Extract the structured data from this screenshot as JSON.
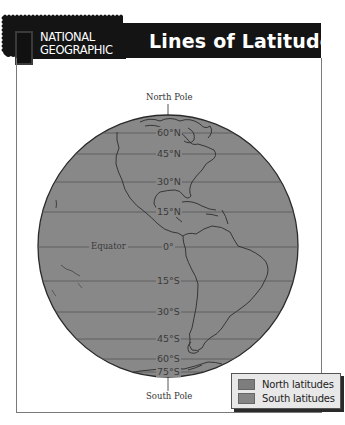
{
  "header": {
    "logo_line1": "NATIONAL",
    "logo_line2": "GEOGRAPHIC",
    "title": "Lines of Latitude"
  },
  "map": {
    "north_pole_label": "North Pole",
    "south_pole_label": "South Pole",
    "equator_label": "Equator",
    "latitudes": [
      {
        "label": "60°N",
        "hemisphere": "north"
      },
      {
        "label": "45°N",
        "hemisphere": "north"
      },
      {
        "label": "30°N",
        "hemisphere": "north"
      },
      {
        "label": "15°N",
        "hemisphere": "north"
      },
      {
        "label": "0°",
        "hemisphere": "equator"
      },
      {
        "label": "15°S",
        "hemisphere": "south"
      },
      {
        "label": "30°S",
        "hemisphere": "south"
      },
      {
        "label": "45°S",
        "hemisphere": "south"
      },
      {
        "label": "60°S",
        "hemisphere": "south"
      },
      {
        "label": "75°S",
        "hemisphere": "south"
      }
    ],
    "colors": {
      "globe": "#888888",
      "lines": "#5a5a5a",
      "coast": "#2e2e2e"
    }
  },
  "legend": {
    "items": [
      {
        "label": "North latitudes",
        "color": "#7d7d7d"
      },
      {
        "label": "South latitudes",
        "color": "#858585"
      }
    ]
  }
}
